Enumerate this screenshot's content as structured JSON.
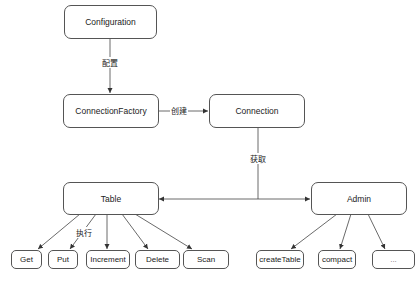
{
  "diagram": {
    "nodes": {
      "configuration": "Configuration",
      "connection_factory": "ConnectionFactory",
      "connection": "Connection",
      "table": "Table",
      "admin": "Admin",
      "get": "Get",
      "put": "Put",
      "increment": "Increment",
      "delete": "Delete",
      "scan": "Scan",
      "create_table": "createTable",
      "compact": "compact",
      "more": "..."
    },
    "edge_labels": {
      "configure": "配置",
      "create": "创建",
      "obtain": "获取",
      "execute": "执行"
    },
    "colors": {
      "line": "#444444",
      "border": "#555555",
      "background": "#ffffff"
    }
  }
}
